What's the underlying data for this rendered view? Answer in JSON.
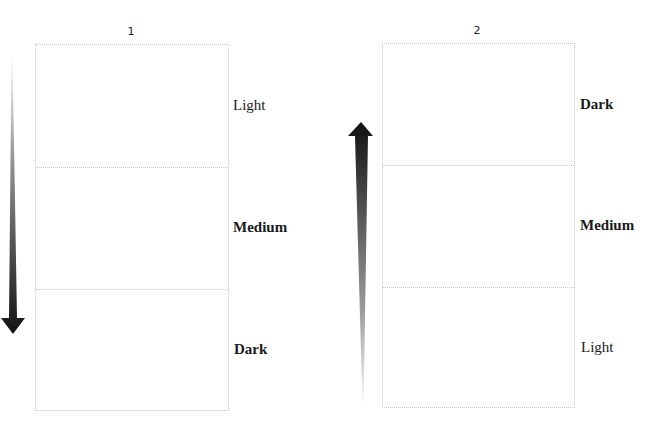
{
  "columns": [
    {
      "title": "1",
      "arrow_direction": "down",
      "rows": [
        {
          "label": "Light",
          "weight": "normal"
        },
        {
          "label": "Medium",
          "weight": "bold"
        },
        {
          "label": "Dark",
          "weight": "bold"
        }
      ]
    },
    {
      "title": "2",
      "arrow_direction": "up",
      "rows": [
        {
          "label": "Dark",
          "weight": "bold"
        },
        {
          "label": "Medium",
          "weight": "bold"
        },
        {
          "label": "Light",
          "weight": "normal"
        }
      ]
    }
  ],
  "colors": {
    "arrow_dark": "#111111",
    "arrow_light": "#ffffff",
    "border": "#c8c8c8",
    "text": "#1a1a1a"
  }
}
